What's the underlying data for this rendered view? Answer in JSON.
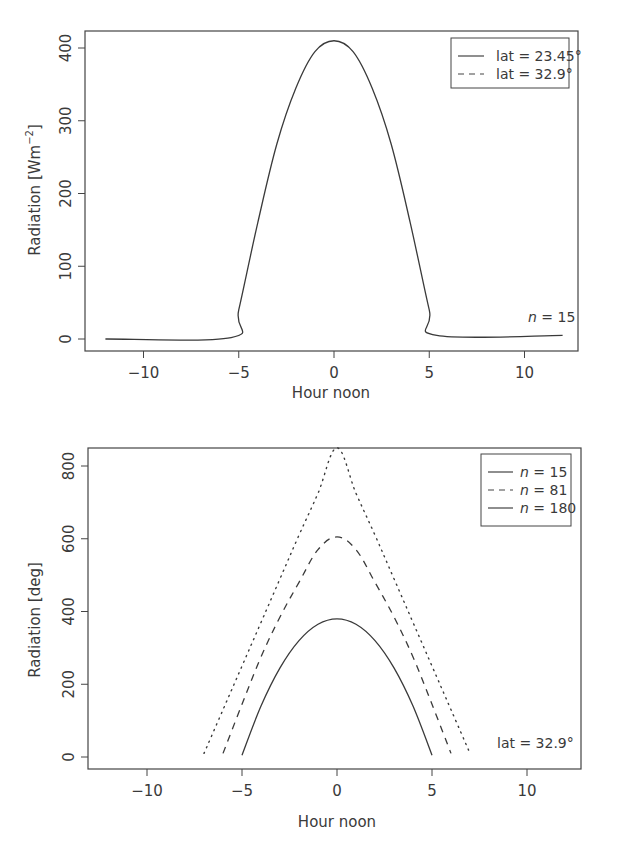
{
  "chart_data": [
    {
      "type": "line",
      "title": "",
      "xlabel": "Hour noon",
      "ylabel": "Radiation [Wm^-2]",
      "ylabel_parts": {
        "base": "Radiation [Wm",
        "sup": "−2",
        "close": "]"
      },
      "xlim": [
        -12.5,
        13.0
      ],
      "ylim": [
        -15,
        425
      ],
      "xticks": [
        -10,
        -5,
        0,
        5,
        10
      ],
      "xtick_labels": [
        "−10",
        "−5",
        "0",
        "5",
        "10"
      ],
      "yticks": [
        0,
        100,
        200,
        300,
        400
      ],
      "ytick_labels": [
        "0",
        "100",
        "200",
        "300",
        "400"
      ],
      "grid": false,
      "legend_position": "top-right",
      "legend": [
        {
          "label": "lat = 23.45°",
          "style": "solid"
        },
        {
          "label": "lat = 32.9°",
          "style": "dashed"
        }
      ],
      "annotation": "n = 15",
      "annotation_parts": {
        "var": "n",
        "rest": " = 15"
      },
      "series": [
        {
          "name": "lat = 23.45°",
          "style": "solid",
          "x": [
            -12,
            -5.4,
            -5,
            -4,
            -3,
            -2,
            -1,
            0,
            1,
            2,
            3,
            4,
            5,
            5.4,
            12
          ],
          "y": [
            0,
            2,
            40,
            160,
            268,
            345,
            395,
            410,
            395,
            345,
            268,
            160,
            40,
            5,
            5
          ]
        }
      ]
    },
    {
      "type": "line",
      "title": "",
      "xlabel": "Hour noon",
      "ylabel": "Radiation [deg]",
      "xlim": [
        -12.8,
        13.2
      ],
      "ylim": [
        -15,
        880
      ],
      "xticks": [
        -10,
        -5,
        0,
        5,
        10
      ],
      "xtick_labels": [
        "−10",
        "−5",
        "0",
        "5",
        "10"
      ],
      "yticks": [
        0,
        200,
        400,
        600,
        800
      ],
      "ytick_labels": [
        "0",
        "200",
        "400",
        "600",
        "800"
      ],
      "grid": false,
      "legend_position": "top-right",
      "legend": [
        {
          "label": "n = 15",
          "var": "n",
          "rest": " = 15",
          "style": "solid"
        },
        {
          "label": "n = 81",
          "var": "n",
          "rest": " = 81",
          "style": "dashed"
        },
        {
          "label": "n = 180",
          "var": "n",
          "rest": " = 180",
          "style": "solid"
        }
      ],
      "annotation": "lat = 32.9°",
      "series": [
        {
          "name": "n = 15",
          "style": "solid",
          "x": [
            -5,
            -4,
            -3,
            -2,
            -1,
            0,
            1,
            2,
            3,
            4,
            5
          ],
          "y": [
            5,
            140,
            245,
            320,
            365,
            380,
            365,
            320,
            245,
            140,
            5
          ]
        },
        {
          "name": "n = 81",
          "style": "dashed",
          "x": [
            -6,
            -5,
            -4,
            -3,
            -2,
            -1,
            0,
            1,
            2,
            3,
            4,
            5,
            6
          ],
          "y": [
            10,
            145,
            275,
            385,
            480,
            570,
            605,
            570,
            480,
            385,
            275,
            145,
            10
          ]
        },
        {
          "name": "n = 180",
          "style": "dotted",
          "x": [
            -7,
            -6,
            -5,
            -4,
            -3,
            -2,
            -1,
            0,
            1,
            2,
            3,
            4,
            5,
            6,
            7
          ],
          "y": [
            10,
            130,
            250,
            370,
            490,
            610,
            725,
            850,
            725,
            610,
            490,
            370,
            250,
            130,
            10
          ]
        }
      ]
    }
  ]
}
